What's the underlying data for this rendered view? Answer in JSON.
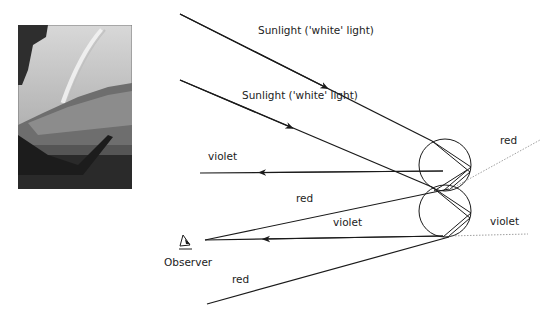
{
  "photo": {
    "description": "rainbow over hillside and lake",
    "alt": "rainbow photograph"
  },
  "labels": {
    "sunlight_1": "Sunlight ('white' light)",
    "sunlight_2": "Sunlight ('white' light)",
    "violet_upper": "violet",
    "red_right_upper": "red",
    "red_middle": "red",
    "violet_middle": "violet",
    "violet_right_lower": "violet",
    "observer": "Observer",
    "red_lower": "red"
  },
  "colors": {
    "line": "#1a1a1a",
    "dotted": "#888888"
  }
}
